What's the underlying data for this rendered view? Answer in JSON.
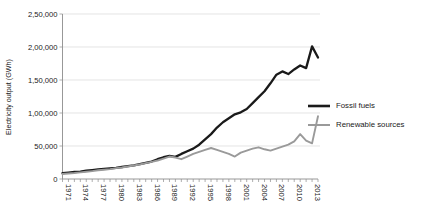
{
  "chart_data": {
    "type": "line",
    "title": "",
    "xlabel": "",
    "ylabel": "Electricity output (GWh)",
    "ylim": [
      0,
      250000
    ],
    "xlim": [
      1971,
      2014
    ],
    "grid": true,
    "legend_position": "right",
    "ytick_labels": [
      "0",
      "50,000",
      "1,00,000",
      "1,50,000",
      "2,00,000",
      "2,50,000"
    ],
    "ytick_values": [
      0,
      50000,
      100000,
      150000,
      200000,
      250000
    ],
    "xtick_labels": [
      "1971",
      "1974",
      "1977",
      "1980",
      "1983",
      "1986",
      "1989",
      "1992",
      "1995",
      "1998",
      "2001",
      "2004",
      "2007",
      "2010",
      "2013"
    ],
    "xtick_values": [
      1971,
      1974,
      1977,
      1980,
      1983,
      1986,
      1989,
      1992,
      1995,
      1998,
      2001,
      2004,
      2007,
      2010,
      2013
    ],
    "x": [
      1971,
      1972,
      1973,
      1974,
      1975,
      1976,
      1977,
      1978,
      1979,
      1980,
      1981,
      1982,
      1983,
      1984,
      1985,
      1986,
      1987,
      1988,
      1989,
      1990,
      1991,
      1992,
      1993,
      1994,
      1995,
      1996,
      1997,
      1998,
      1999,
      2000,
      2001,
      2002,
      2003,
      2004,
      2005,
      2006,
      2007,
      2008,
      2009,
      2010,
      2011,
      2012,
      2013,
      2014
    ],
    "series": [
      {
        "name": "Fossil fuels",
        "color": "#1a1a1a",
        "width": 2.3,
        "values": [
          9000,
          9800,
          10600,
          11200,
          12500,
          13600,
          14500,
          15400,
          16200,
          17000,
          18200,
          19500,
          20800,
          22500,
          24500,
          26500,
          30000,
          33000,
          35000,
          33500,
          38000,
          42000,
          46000,
          52000,
          60000,
          68000,
          78000,
          86000,
          92000,
          98000,
          101000,
          106000,
          115000,
          124000,
          133000,
          145000,
          158000,
          163000,
          159000,
          166000,
          172000,
          168000,
          201000,
          184000
        ]
      },
      {
        "name": "Renewable sources",
        "color": "#9a9a9a",
        "width": 1.9,
        "values": [
          7500,
          8300,
          9000,
          10000,
          11000,
          12000,
          13200,
          14000,
          15000,
          16500,
          17500,
          19000,
          20500,
          22000,
          24000,
          26000,
          28000,
          31000,
          34000,
          32500,
          30000,
          34000,
          38000,
          41000,
          44000,
          47000,
          44000,
          41000,
          38000,
          34000,
          40000,
          43000,
          46000,
          48000,
          45000,
          43000,
          46000,
          49000,
          52000,
          57000,
          68000,
          58000,
          54000,
          95000
        ]
      }
    ]
  },
  "legend": {
    "items": [
      {
        "label": "Fossil fuels",
        "color": "#1a1a1a"
      },
      {
        "label": "Renewable sources",
        "color": "#9a9a9a"
      }
    ]
  }
}
